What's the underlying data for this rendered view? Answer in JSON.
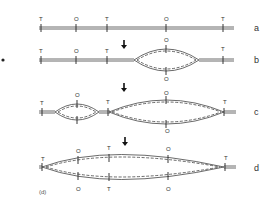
{
  "figure": {
    "caption": "(d)",
    "rows": [
      {
        "id": "a",
        "label": "a"
      },
      {
        "id": "b",
        "label": "b"
      },
      {
        "id": "c",
        "label": "c"
      },
      {
        "id": "d",
        "label": "d"
      }
    ],
    "markers": {
      "terminus": "T",
      "origin": "O"
    },
    "row_a": {
      "top": [
        "T",
        "O",
        "T",
        "O",
        "T"
      ]
    },
    "row_b": {
      "top": [
        "T",
        "O",
        "T",
        "O",
        "T"
      ],
      "bottom": [
        "O"
      ]
    },
    "row_c": {
      "top": [
        "T",
        "O",
        "T",
        "O",
        "T"
      ],
      "bottom": [
        "O"
      ]
    },
    "row_d": {
      "top": [
        "T",
        "O",
        "T",
        "O",
        "T"
      ],
      "bottom": [
        "O",
        "T",
        "O"
      ]
    },
    "arrows": [
      "arrow-down",
      "arrow-down",
      "arrow-down"
    ]
  }
}
